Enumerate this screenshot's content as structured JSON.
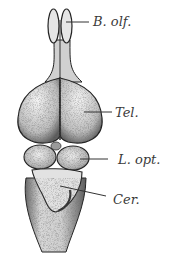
{
  "figure": {
    "background": "#ffffff",
    "ink_color": "#2a2a2a",
    "labels": [
      {
        "id": "bulbus-olfactorius",
        "text": "B. olf.",
        "x": 93,
        "y": 15
      },
      {
        "id": "telencephalon",
        "text": "Tel.",
        "x": 115,
        "y": 108
      },
      {
        "id": "lobus-opticus",
        "text": "L. opt.",
        "x": 118,
        "y": 153
      },
      {
        "id": "cerebellum",
        "text": "Cer.",
        "x": 113,
        "y": 193
      }
    ]
  }
}
